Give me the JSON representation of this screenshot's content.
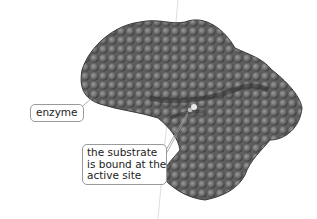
{
  "diagram": {
    "labels": {
      "enzyme": "enzyme",
      "substrate_lines": [
        "the substrate",
        "is bound at the",
        "active site"
      ]
    },
    "colors": {
      "protein_dark": "#3f3f3f",
      "protein_mid": "#6b6b6b",
      "protein_light": "#8e8e8e",
      "callout_border": "#9a9a9a",
      "text": "#222222"
    }
  }
}
